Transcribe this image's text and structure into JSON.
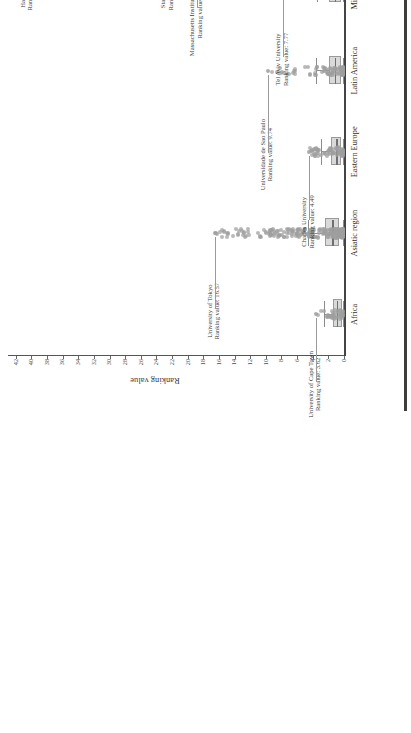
{
  "chart_data": {
    "type": "box",
    "title": "",
    "xlabel": "",
    "ylabel": "Ranking value",
    "ylim": [
      0,
      43
    ],
    "ytick_labels": [
      "42",
      "40",
      "38",
      "36",
      "34",
      "32",
      "30",
      "28",
      "26",
      "24",
      "22",
      "20",
      "18",
      "16",
      "14",
      "12",
      "10",
      "8",
      "6",
      "4",
      "2",
      "0"
    ],
    "ytick_values": [
      42,
      40,
      38,
      36,
      34,
      32,
      30,
      28,
      26,
      24,
      22,
      20,
      18,
      16,
      14,
      12,
      10,
      8,
      6,
      4,
      2,
      0
    ],
    "grid": false,
    "legend": "none",
    "orientation": "vertical-boxes-rotated-page",
    "categories": [
      "Africa",
      "Asiatic region",
      "Eastern Europe",
      "Latin America",
      "Middle East",
      "Northern America",
      "Pacific region",
      "Western Europe"
    ],
    "series": [
      {
        "name": "Africa",
        "q1": 0.55,
        "median": 0.95,
        "q3": 1.45,
        "whisker_low": 0.1,
        "whisker_high": 2.5,
        "max_outlier": 3.62,
        "n_points": 40
      },
      {
        "name": "Asiatic region",
        "q1": 0.9,
        "median": 1.5,
        "q3": 2.4,
        "whisker_low": 0.1,
        "whisker_high": 4.6,
        "max_outlier": 16.57,
        "n_points": 240
      },
      {
        "name": "Eastern Europe",
        "q1": 0.6,
        "median": 1.0,
        "q3": 1.6,
        "whisker_low": 0.1,
        "whisker_high": 3.0,
        "max_outlier": 4.49,
        "n_points": 70
      },
      {
        "name": "Latin America",
        "q1": 0.7,
        "median": 1.2,
        "q3": 1.9,
        "whisker_low": 0.1,
        "whisker_high": 3.6,
        "max_outlier": 9.74,
        "n_points": 90
      },
      {
        "name": "Middle East",
        "q1": 0.7,
        "median": 1.2,
        "q3": 1.9,
        "whisker_low": 0.1,
        "whisker_high": 3.5,
        "max_outlier": 7.77,
        "n_points": 60
      },
      {
        "name": "Northern America",
        "q1": 1.3,
        "median": 2.3,
        "q3": 3.9,
        "whisker_low": 0.1,
        "whisker_high": 7.6,
        "max_outlier": 40.5,
        "n_points": 260
      },
      {
        "name": "Pacific region",
        "q1": 1.5,
        "median": 2.6,
        "q3": 4.2,
        "whisker_low": 0.1,
        "whisker_high": 8.2,
        "max_outlier": 9.89,
        "n_points": 55
      },
      {
        "name": "Western Europe",
        "q1": 1.4,
        "median": 2.4,
        "q3": 4.0,
        "whisker_low": 0.1,
        "whisker_high": 8.0,
        "max_outlier": 17.92,
        "n_points": 280
      }
    ],
    "annotations": [
      {
        "id": "cape-town",
        "category": "Africa",
        "university": "University of Cape Town",
        "value_label": "Ranking value: 3.62",
        "value": 3.62
      },
      {
        "id": "tokyo",
        "category": "Asiatic region",
        "university": "University of Tokyo",
        "value_label": "Ranking value: 16.57",
        "value": 16.57
      },
      {
        "id": "charles",
        "category": "Eastern Europe",
        "university": "Charles University",
        "value_label": "Ranking value: 4.49",
        "value": 4.49
      },
      {
        "id": "sao-paulo",
        "category": "Latin America",
        "university": "Universidade de Sao Paulo",
        "value_label": "Ranking value: 9.74",
        "value": 9.74
      },
      {
        "id": "tel-aviv",
        "category": "Middle East",
        "university": "Tel Aviv University",
        "value_label": "Ranking value: 7.77",
        "value": 7.77
      },
      {
        "id": "harvard",
        "category": "Northern America",
        "university": "Harvard University",
        "value_label": "Ranking value: 40.50",
        "value": 40.5
      },
      {
        "id": "stanford",
        "category": "Northern America",
        "university": "Stanford University",
        "value_label": "Ranking value: 22.51",
        "value": 22.51
      },
      {
        "id": "mit",
        "category": "Northern America",
        "university": "Massachusetts Institute of Technology",
        "value_label": "Ranking value: 18.77",
        "value": 18.77
      },
      {
        "id": "melbourne",
        "category": "Pacific region",
        "university": "University of Melbourne",
        "value_label": "Ranking value: 9.89",
        "value": 9.89
      },
      {
        "id": "oxford",
        "category": "Western Europe",
        "university": "University of Oxford",
        "value_label": "Ranking value: 17.92",
        "value": 17.92
      }
    ],
    "colors": {
      "box_fill": "#d9d9d9",
      "box_edge": "#9a9a9a",
      "median": "#6f6f6f",
      "point": "#9e9e9e",
      "axis": "#444444",
      "text": "#3a3a3a"
    }
  }
}
